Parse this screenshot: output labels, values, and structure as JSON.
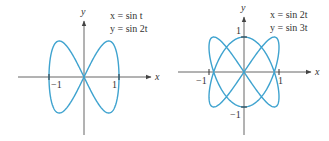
{
  "chart_data": [
    {
      "type": "line",
      "subtype": "parametric",
      "equations": {
        "x": "x = sin t",
        "y": "y = sin 2t"
      },
      "xlabel": "x",
      "ylabel": "y",
      "x_ticks": [
        "−1",
        "1"
      ],
      "y_ticks": [],
      "xlim": [
        -1,
        1
      ],
      "ylim": [
        -1,
        1
      ],
      "grid": false,
      "legend": "none",
      "curve_color": "#3fa3cf",
      "parameter_range": [
        0,
        6.2832
      ]
    },
    {
      "type": "line",
      "subtype": "parametric",
      "equations": {
        "x": "x = sin 2t",
        "y": "y = sin 3t"
      },
      "xlabel": "x",
      "ylabel": "y",
      "x_ticks": [
        "−1",
        "1"
      ],
      "y_ticks": [
        "1",
        "−1"
      ],
      "xlim": [
        -1,
        1
      ],
      "ylim": [
        -1,
        1
      ],
      "grid": false,
      "legend": "none",
      "curve_color": "#3fa3cf",
      "parameter_range": [
        0,
        6.2832
      ]
    }
  ],
  "left": {
    "eq_x": "x = sin t",
    "eq_y": "y = sin 2t",
    "axis_x": "x",
    "axis_y": "y",
    "tick_neg1": "−1",
    "tick_pos1": "1"
  },
  "right": {
    "eq_x": "x = sin 2t",
    "eq_y": "y = sin 3t",
    "axis_x": "x",
    "axis_y": "y",
    "tick_x_neg1": "−1",
    "tick_x_pos1": "1",
    "tick_y_pos1": "1",
    "tick_y_neg1": "−1"
  },
  "colors": {
    "curve": "#3fa3cf",
    "axis": "#555555",
    "text": "#333333"
  }
}
